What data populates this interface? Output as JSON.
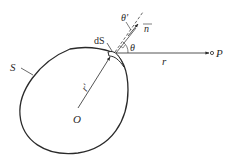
{
  "diagram": {
    "labels": {
      "surface": "S",
      "surface_element": "dS",
      "origin": "O",
      "source_vector": "r'",
      "distance": "r",
      "point": "P",
      "normal": "n",
      "angle": "θ",
      "angle_prime": "θ'"
    },
    "colors": {
      "stroke": "#2a2a2a",
      "background": "#ffffff"
    }
  }
}
